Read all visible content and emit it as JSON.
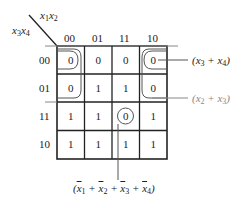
{
  "kmap": {
    "column_variables": "x1x2",
    "row_variables": "x3x4",
    "column_headers": [
      "00",
      "01",
      "11",
      "10"
    ],
    "row_headers": [
      "00",
      "01",
      "11",
      "10"
    ],
    "cells": [
      [
        "0",
        "0",
        "0",
        "0"
      ],
      [
        "0",
        "1",
        "1",
        "0"
      ],
      [
        "1",
        "1",
        "0",
        "1"
      ],
      [
        "1",
        "1",
        "1",
        "1"
      ]
    ],
    "groupings": [
      {
        "name": "x3+x4",
        "cells": [
          [
            0,
            0
          ],
          [
            0,
            3
          ]
        ],
        "label": "(x3 + x4)"
      },
      {
        "name": "x2+x3",
        "cells": [
          [
            0,
            0
          ],
          [
            1,
            0
          ],
          [
            0,
            3
          ],
          [
            1,
            3
          ]
        ],
        "label": "(x2 + x3)"
      },
      {
        "name": "notx1+notx2+notx3+notx4",
        "cells": [
          [
            2,
            2
          ]
        ],
        "label": "(x̄1 + x̄2 + x̄3 + x̄4)"
      }
    ]
  },
  "colors": {
    "line": "#222222",
    "loop": "#555555",
    "gray_text": "#888888"
  }
}
